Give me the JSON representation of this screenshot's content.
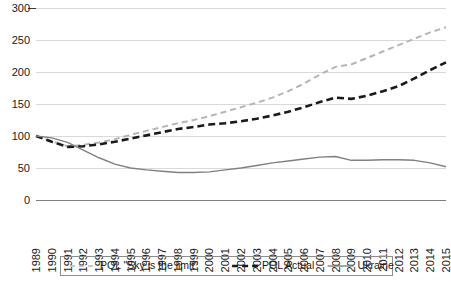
{
  "chart_data": {
    "type": "line",
    "title": "",
    "xlabel": "",
    "ylabel": "",
    "ylim": [
      0,
      300
    ],
    "yticks": [
      0,
      50,
      100,
      150,
      200,
      250,
      300
    ],
    "grid": true,
    "legend_position": "bottom",
    "x": [
      1989,
      1990,
      1991,
      1992,
      1993,
      1994,
      1995,
      1996,
      1997,
      1998,
      1999,
      2000,
      2001,
      2002,
      2003,
      2004,
      2005,
      2006,
      2007,
      2008,
      2009,
      2010,
      2011,
      2012,
      2013,
      2014,
      2015
    ],
    "categories": [
      "1989",
      "1990",
      "1991",
      "1992",
      "1993",
      "1994",
      "1995",
      "1996",
      "1997",
      "1998",
      "1999",
      "2000",
      "2001",
      "2002",
      "2003",
      "2004",
      "2005",
      "2006",
      "2007",
      "2008",
      "2009",
      "2010",
      "2011",
      "2012",
      "2013",
      "2014",
      "2015"
    ],
    "series": [
      {
        "name": "POL \"Sky is the limit\"",
        "style": "dashed",
        "color": "#b5b5b5",
        "width": 2,
        "values": [
          100,
          92,
          84,
          86,
          90,
          95,
          102,
          108,
          114,
          120,
          125,
          131,
          138,
          145,
          152,
          160,
          170,
          182,
          196,
          208,
          212,
          222,
          232,
          242,
          252,
          262,
          270
        ]
      },
      {
        "name": "POL Actual",
        "style": "dashed",
        "color": "#1a1a1a",
        "width": 2.6,
        "values": [
          100,
          91,
          83,
          84,
          87,
          91,
          96,
          101,
          106,
          111,
          114,
          118,
          120,
          123,
          127,
          132,
          138,
          145,
          153,
          160,
          158,
          163,
          170,
          178,
          190,
          203,
          215
        ]
      },
      {
        "name": "Ukraine",
        "style": "solid",
        "color": "#808080",
        "width": 1.4,
        "values": [
          100,
          97,
          90,
          78,
          66,
          56,
          50,
          47,
          45,
          43,
          43,
          44,
          47,
          50,
          54,
          58,
          61,
          64,
          67,
          68,
          62,
          62,
          63,
          63,
          62,
          58,
          52
        ]
      }
    ]
  },
  "legend": {
    "items": [
      {
        "label": "POL \"Sky is the limit\"",
        "style": "dashed",
        "color": "#b5b5b5"
      },
      {
        "label": "POL Actual",
        "style": "dashed",
        "color": "#1a1a1a"
      },
      {
        "label": "Ukraine",
        "style": "solid",
        "color": "#808080"
      }
    ]
  }
}
